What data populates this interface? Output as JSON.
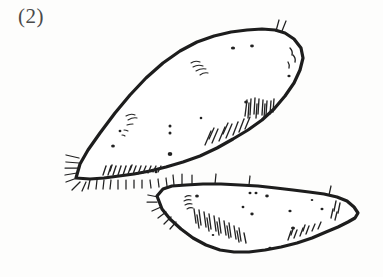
{
  "figure": {
    "label": "(2)",
    "medium": "pen-and-ink line drawing",
    "background_color": "#fdfdfc",
    "ink_color": "#1d1d1d",
    "canvas": {
      "width": 383,
      "height": 277
    }
  },
  "objects": [
    {
      "name": "upper-tuber",
      "description": "large elongated tuber, long axis from lower-left to upper-right",
      "outline_path": "M 76 178 L 80 164 L 88 150 L 100 133 L 115 113 L 130 95 L 146 78 L 163 63 L 180 51 L 197 42 L 214 36 L 231 32 L 247 30 L 262 29 L 275 30 L 285 33 L 294 39 L 301 48 L 303 58 L 300 70 L 294 83 L 285 96 L 274 109 L 262 120 L 248 130 L 233 139 L 217 148 L 200 156 L 183 162 L 166 167 L 150 171 L 134 174 L 119 176 L 104 178 L 90 179 Z",
      "hatch_groups": [
        {
          "name": "upper-right-edge-hatch",
          "count": 11
        },
        {
          "name": "lower-right-edge-hatch",
          "count": 9
        },
        {
          "name": "bottom-edge-hatch",
          "count": 14
        },
        {
          "name": "left-tip-hair",
          "count": 7
        },
        {
          "name": "interior-scribble-left",
          "count": 5
        },
        {
          "name": "top-ridge-scribble",
          "count": 4
        },
        {
          "name": "top-right-hair",
          "count": 2
        }
      ],
      "speck_count": 11
    },
    {
      "name": "lower-tuber",
      "description": "smaller elongated tuber, long axis roughly horizontal, point at right",
      "outline_path": "M 157 196 L 163 189 L 172 186 L 186 185 L 203 184 L 221 184 L 240 185 L 258 186 L 276 188 L 293 190 L 309 192 L 324 194 L 337 197 L 347 201 L 354 207 L 358 213 L 355 218 L 348 222 L 338 227 L 326 232 L 312 238 L 297 243 L 281 247 L 265 250 L 249 252 L 234 252 L 220 250 L 206 245 L 193 238 L 181 229 L 170 219 L 162 209 Z",
      "hatch_groups": [
        {
          "name": "top-edge-hair",
          "count": 6
        },
        {
          "name": "left-tip-hair",
          "count": 6
        },
        {
          "name": "lower-left-edge-hatch",
          "count": 16
        },
        {
          "name": "bottom-right-hatch",
          "count": 8
        },
        {
          "name": "right-tip-hatch",
          "count": 4
        }
      ],
      "speck_count": 12
    }
  ]
}
